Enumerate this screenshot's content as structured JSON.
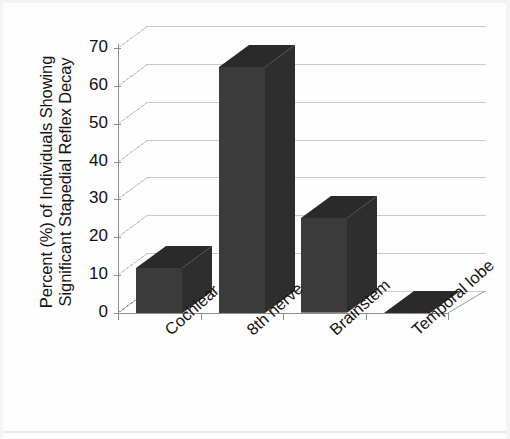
{
  "chart_data": {
    "type": "bar",
    "title": "",
    "subtitle": "",
    "xlabel": "",
    "ylabel": "Percent (%) of Individuals Showing Significant Stapedial Reflex Decay",
    "ylabel_lines": [
      "Percent (%) of Individuals Showing",
      "Significant Stapedial Reflex Decay"
    ],
    "categories": [
      "Cochlear",
      "8th nerve",
      "Brainstem",
      "Temporal lobe"
    ],
    "values": [
      12,
      65,
      25,
      0
    ],
    "ylim": [
      0,
      70
    ],
    "ytick_labels": [
      "0",
      "10",
      "20",
      "30",
      "40",
      "50",
      "60",
      "70"
    ],
    "ytick_values": [
      0,
      10,
      20,
      30,
      40,
      50,
      60,
      70
    ],
    "grid": true,
    "legend": "none",
    "style": "3d-column",
    "bar_color": "#3b3b3b",
    "bar_top_color": "#2a2a2a",
    "bar_side_color": "#2e2e2e",
    "grid_color": "#c9c9c9",
    "axis_color": "#8d8d8d",
    "text_color": "#141414",
    "background": "#fdfdfd"
  }
}
